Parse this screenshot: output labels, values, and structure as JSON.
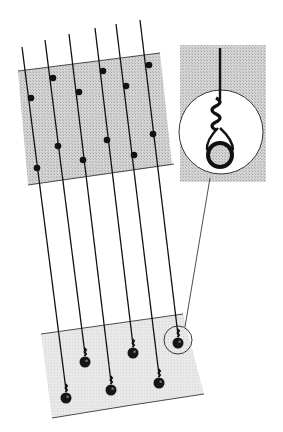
{
  "figure": {
    "line_count": 6,
    "upper_panel_dot_count": 12,
    "sinker_count": 6,
    "colors": {
      "ink": "#111111",
      "upper_panel": "#c9c9c9",
      "lower_panel": "#e6e6e6",
      "inset_panel": "#d2d2d2",
      "background": "#ffffff"
    }
  }
}
